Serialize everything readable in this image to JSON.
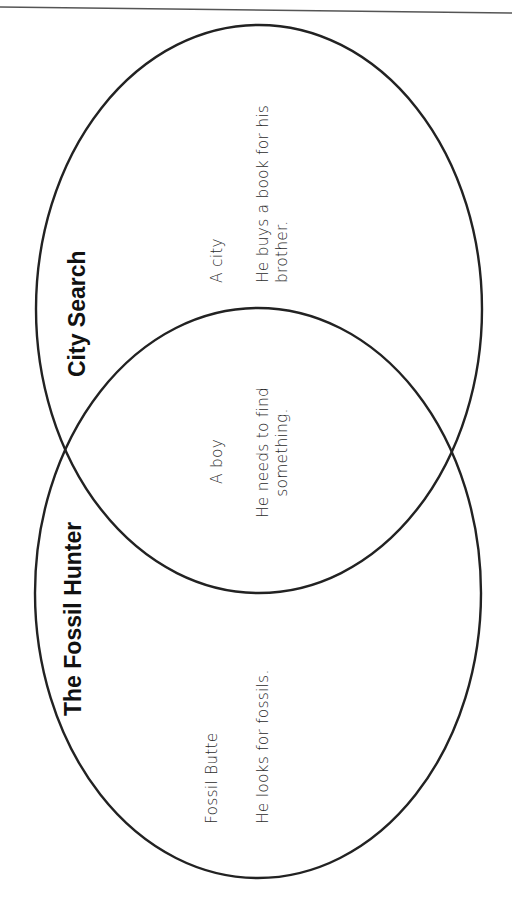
{
  "diagram": {
    "type": "venn",
    "orientation": "rotated-90-ccw",
    "colors": {
      "outline": "#222222",
      "text": "#2b2b2b",
      "background": "#ffffff"
    },
    "sets": [
      {
        "id": "city-search",
        "title": "City Search",
        "items": [
          "A city",
          "He buys a book for his brother."
        ],
        "item_lines": {
          "setting": "A city",
          "event_line1": "He buys a book for his",
          "event_line2": "brother."
        }
      },
      {
        "id": "fossil-hunter",
        "title": "The Fossil Hunter",
        "items": [
          "Fossil Butte",
          "He looks for fossils."
        ],
        "item_lines": {
          "setting": "Fossil Butte",
          "event_line1": "He looks for fossils."
        }
      }
    ],
    "overlap": {
      "items": [
        "A boy",
        "He needs to find something."
      ],
      "item_lines": {
        "character": "A boy",
        "event_line1": "He needs to find",
        "event_line2": "something."
      }
    }
  }
}
